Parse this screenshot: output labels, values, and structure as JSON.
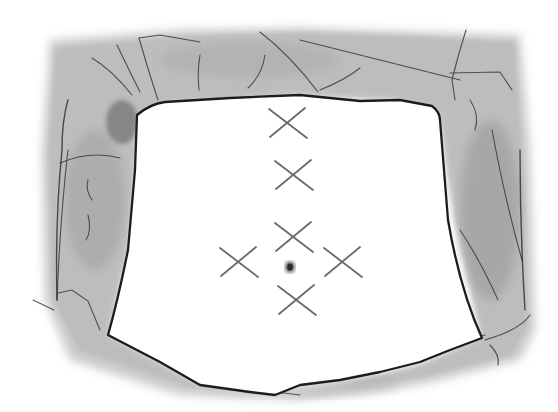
{
  "illustration": {
    "subject": "abdomen-with-surgical-drapes-and-port-site-marks",
    "colors": {
      "background": "#ffffff",
      "drape_fill": "#b4b4b4",
      "drape_edge": "#2a2a2a",
      "mark_stroke": "#6a6a6a",
      "umbilicus": "#3a3a3a"
    },
    "port_marks": [
      {
        "id": "port-1",
        "cx": 288,
        "cy": 123
      },
      {
        "id": "port-2",
        "cx": 294,
        "cy": 175
      },
      {
        "id": "port-3",
        "cx": 294,
        "cy": 237
      },
      {
        "id": "port-left",
        "cx": 239,
        "cy": 262
      },
      {
        "id": "port-right",
        "cx": 343,
        "cy": 262
      },
      {
        "id": "port-bottom",
        "cx": 297,
        "cy": 300
      }
    ],
    "umbilicus": {
      "cx": 290,
      "cy": 267
    }
  }
}
